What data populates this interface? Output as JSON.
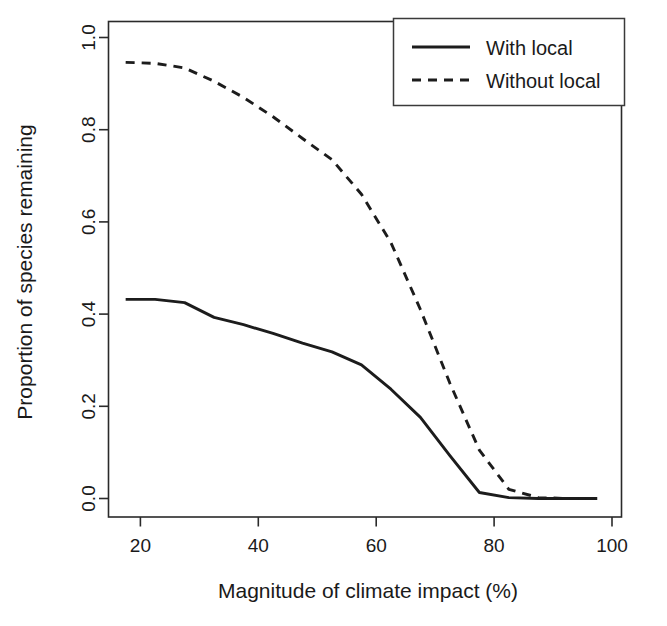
{
  "chart_data": {
    "type": "line",
    "title": "",
    "subtitle": "",
    "xlabel": "Magnitude of climate impact (%)",
    "ylabel": "Proportion of species remaining",
    "xlim": [
      14.0,
      101.0
    ],
    "ylim": [
      -0.035,
      1.0
    ],
    "xticks": [
      20,
      40,
      60,
      80,
      100
    ],
    "xticklabels": [
      "20",
      "40",
      "60",
      "80",
      "100"
    ],
    "yticks": [
      0.0,
      0.2,
      0.4,
      0.6,
      0.8,
      1.0
    ],
    "yticklabels": [
      "0.0",
      "0.2",
      "0.4",
      "0.6",
      "0.8",
      "1.0"
    ],
    "grid": false,
    "legend_position": "top-right",
    "legend": [
      "With local",
      "Without local"
    ],
    "series": [
      {
        "name": "With local",
        "style": "solid",
        "color": "#1c1c1c",
        "x": [
          17.5,
          22.5,
          27.5,
          32.5,
          37.5,
          42.5,
          47.5,
          52.5,
          57.5,
          62.5,
          67.5,
          72.5,
          77.5,
          82.5,
          87.5,
          92.5,
          97.5
        ],
        "y": [
          0.432,
          0.432,
          0.425,
          0.393,
          0.377,
          0.358,
          0.337,
          0.318,
          0.29,
          0.237,
          0.176,
          0.093,
          0.013,
          0.002,
          0.0,
          0.0,
          0.0
        ]
      },
      {
        "name": "Without local",
        "style": "dashed",
        "color": "#1c1c1c",
        "x": [
          17.5,
          22.5,
          27.5,
          32.5,
          37.5,
          42.5,
          47.5,
          52.5,
          57.5,
          62.5,
          67.5,
          72.5,
          77.5,
          82.5,
          87.5,
          92.5,
          97.5
        ],
        "y": [
          0.946,
          0.944,
          0.934,
          0.905,
          0.87,
          0.828,
          0.781,
          0.735,
          0.66,
          0.555,
          0.41,
          0.25,
          0.105,
          0.02,
          0.002,
          0.0,
          0.0
        ]
      }
    ]
  },
  "legend": {
    "items": [
      {
        "label": "With local",
        "style": "solid"
      },
      {
        "label": "Without local",
        "style": "dashed"
      }
    ]
  },
  "axes": {
    "x_title": "Magnitude of climate impact (%)",
    "y_title": "Proportion of species remaining",
    "x_ticks": [
      "20",
      "40",
      "60",
      "80",
      "100"
    ],
    "y_ticks": [
      "0.0",
      "0.2",
      "0.4",
      "0.6",
      "0.8",
      "1.0"
    ]
  }
}
